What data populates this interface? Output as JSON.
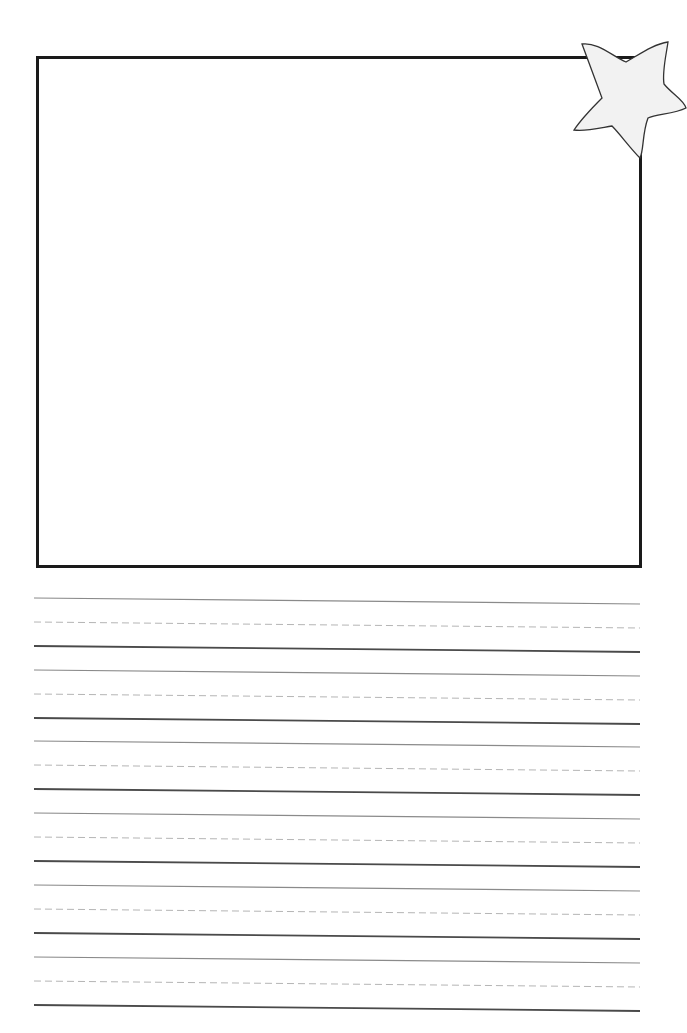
{
  "page": {
    "type": "handwriting-worksheet",
    "background": "#ffffff"
  },
  "picture_frame": {
    "x": 36,
    "y": 56,
    "width": 603,
    "height": 509,
    "border_color": "#1a1a1a",
    "border_width": 3
  },
  "star": {
    "icon": "star-icon",
    "fill": "#f2f2f2",
    "stroke": "#333333"
  },
  "writing_lines": {
    "x_start": 34,
    "x_end": 640,
    "slant": 6,
    "colors": {
      "top": "#8a8a8a",
      "mid": "#b5b5b5",
      "base": "#4a4a4a"
    },
    "groups": [
      {
        "top": 598,
        "mid": 622,
        "base": 646
      },
      {
        "top": 670,
        "mid": 694,
        "base": 718
      },
      {
        "top": 741,
        "mid": 765,
        "base": 789
      },
      {
        "top": 813,
        "mid": 837,
        "base": 861
      },
      {
        "top": 885,
        "mid": 909,
        "base": 933
      },
      {
        "top": 957,
        "mid": 981,
        "base": 1005
      }
    ]
  }
}
